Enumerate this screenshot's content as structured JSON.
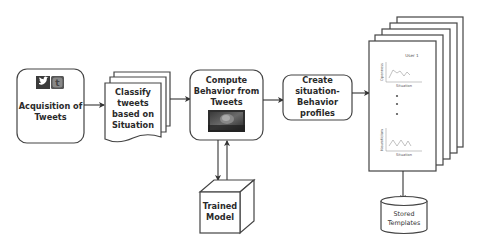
{
  "diagram": {
    "nodes": {
      "acquisition": {
        "line1": "Acquisition of",
        "line2": "Tweets",
        "icons": [
          "twitter-bird-icon",
          "twitter-t-icon"
        ]
      },
      "classify": {
        "line1": "Classify",
        "line2": "tweets",
        "line3": "based on",
        "line4": "Situation"
      },
      "compute": {
        "line1": "Compute",
        "line2": "Behavior from",
        "line3": "Tweets",
        "image": "brain-image"
      },
      "create": {
        "line1": "Create",
        "line2": "situation-",
        "line3": "Behavior",
        "line4": "profiles"
      },
      "trained_model": {
        "line1": "Trained",
        "line2": "Model"
      },
      "profiles_stack": {
        "title": "User 1",
        "chart_top": {
          "ylabel": "Openness",
          "xlabel": "Situation"
        },
        "chart_bottom": {
          "ylabel": "Neuroticism",
          "xlabel": "Situation"
        },
        "pages": 5
      },
      "stored": {
        "line1": "Stored",
        "line2": "Templates"
      }
    },
    "edges": [
      {
        "from": "acquisition",
        "to": "classify"
      },
      {
        "from": "classify",
        "to": "compute"
      },
      {
        "from": "compute",
        "to": "create"
      },
      {
        "from": "create",
        "to": "profiles_stack"
      },
      {
        "from": "compute",
        "to": "trained_model"
      },
      {
        "from": "trained_model",
        "to": "compute"
      },
      {
        "from": "profiles_stack",
        "to": "stored"
      }
    ],
    "colors": {
      "stroke": "#444444",
      "text": "#2a2a2a",
      "background": "#ffffff"
    }
  }
}
